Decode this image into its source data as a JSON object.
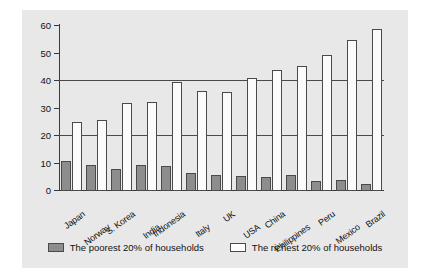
{
  "chart_data": {
    "type": "bar",
    "title": "",
    "xlabel": "",
    "ylabel": "Percentage",
    "ylim": [
      0,
      60
    ],
    "yticks": [
      0,
      10,
      20,
      30,
      40,
      50,
      60
    ],
    "grid": "horizontal gridlines at 20 and 40",
    "legend_position": "bottom-center",
    "categories": [
      "Japan",
      "Norway",
      "S. Korea",
      "India",
      "Indonesia",
      "Italy",
      "UK",
      "USA",
      "China",
      "Philippines",
      "Peru",
      "Mexico",
      "Brazil"
    ],
    "series": [
      {
        "name": "The poorest 20% of households",
        "color": "#8d8d8d",
        "values": [
          11,
          9.5,
          8,
          9.5,
          9,
          6.5,
          6,
          5.5,
          5,
          6,
          3.5,
          4,
          2.5
        ]
      },
      {
        "name": "The richest 20% of households",
        "color": "#fbfbfb",
        "values": [
          25,
          26,
          32,
          32.5,
          39.5,
          36.5,
          36,
          41,
          44,
          45.5,
          49.5,
          55,
          59
        ]
      }
    ]
  },
  "axis": {
    "y_label": "Percentage",
    "y_tick_labels": [
      "0",
      "10",
      "20",
      "30",
      "40",
      "50",
      "60"
    ]
  },
  "legend": {
    "items": [
      {
        "label": "The poorest 20% of households",
        "swatch": "poor"
      },
      {
        "label": "The richest 20% of households",
        "swatch": "rich"
      }
    ]
  }
}
